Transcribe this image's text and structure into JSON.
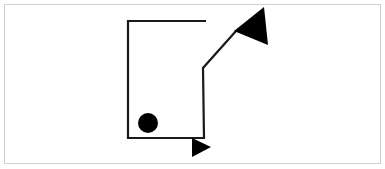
{
  "canvas": {
    "width": 385,
    "height": 169,
    "background_color": "#ffffff"
  },
  "frame": {
    "label": "figure-border",
    "x": 4.5,
    "y": 4.5,
    "width": 376,
    "height": 159,
    "stroke_color": "#cfcfcf",
    "stroke_width": 1,
    "fill": "none"
  },
  "shapes": {
    "stroke_color": "#1a1a1a",
    "fill_color": "#000000",
    "polyline": {
      "label": "open-rectangle-path",
      "points": "206,21 128,21 128,138 204,138 203,68 236,31",
      "stroke_width": 2.2,
      "fill": "none"
    },
    "circle": {
      "label": "filled-circle",
      "cx": 148,
      "cy": 123,
      "r": 10,
      "fill": "#000000"
    },
    "large_triangle": {
      "label": "large-left-pointing-triangle",
      "points": "264,7 268,45 234,31",
      "fill": "#000000"
    },
    "small_triangle": {
      "label": "small-right-pointing-triangle",
      "points": "192,138 211,147 192,157",
      "fill": "#000000"
    }
  }
}
